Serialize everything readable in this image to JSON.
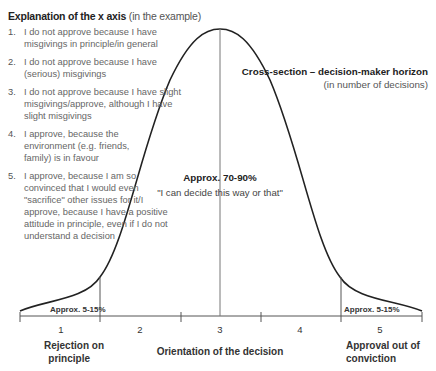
{
  "legend": {
    "title_bold": "Explanation of the x axis",
    "title_suffix": " (in the example)",
    "items": [
      {
        "num": "1.",
        "text": "I do not approve because I have misgivings in principle/in general"
      },
      {
        "num": "2.",
        "text": "I do not approve because I have (serious) misgivings"
      },
      {
        "num": "3.",
        "text": "I do not approve because I have slight misgivings/approve, although I have slight misgivings"
      },
      {
        "num": "4.",
        "text": "I approve, because the environment (e.g. friends, family) is in favour"
      },
      {
        "num": "5.",
        "text": "I approve, because I am so convinced that I would even \"sacrifice\" other issues for it/I approve, because I have a positive attitude in principle, even if I do not understand a decision"
      }
    ]
  },
  "curve_label": {
    "title": "Cross-section – decision-maker horizon",
    "subtitle": "(in number of decisions)"
  },
  "center": {
    "percent": "Approx. 70-90%",
    "quote": "\"I can decide this way or that\""
  },
  "tails": {
    "left": "Approx. 5-15%",
    "right": "Approx. 5-15%"
  },
  "axis": {
    "ticks": [
      "1",
      "2",
      "3",
      "4",
      "5"
    ],
    "left_label": "Rejection on principle",
    "left_label_l1": "Rejection on",
    "left_label_l2": "principle",
    "center_label": "Orientation of the decision",
    "right_label_l1": "Approval out of",
    "right_label_l2": "conviction"
  },
  "colors": {
    "curve": "#222222",
    "axis": "#555555",
    "divider": "#666666"
  }
}
